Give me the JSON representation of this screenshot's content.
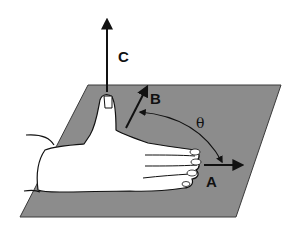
{
  "diagram": {
    "labels": {
      "vector_c": "C",
      "vector_b": "B",
      "vector_a": "A",
      "angle": "θ"
    },
    "colors": {
      "plane_fill": "#8c8c8c",
      "plane_edge": "#3a3a3a",
      "hand_fill": "#ffffff",
      "ink": "#111111"
    }
  }
}
